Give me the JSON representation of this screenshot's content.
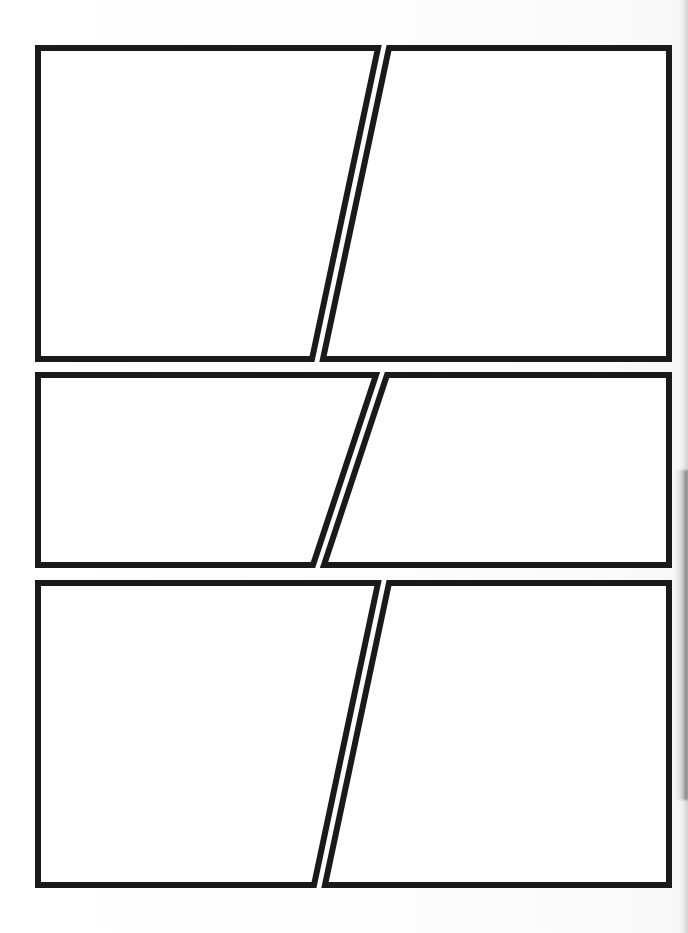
{
  "document": {
    "kind": "comic-page-template",
    "title": "Blank Comic Book Page Template",
    "page_width": 688,
    "page_height": 933,
    "background_color": "#fdfdfd",
    "border_color": "#1a1a1a",
    "panel_fill_color": "#ffffff",
    "border_thickness_px": 6,
    "row_count": 3,
    "panels_per_row": 2,
    "total_panels": 6,
    "text_content": "",
    "notes_visible": ""
  },
  "artifact": {
    "name": "scan-edge-shadow",
    "edge": "right",
    "color": "#4a4a4a"
  },
  "rows": [
    {
      "id": "row-1",
      "label": "Row 1",
      "top": 45,
      "bottom": 362,
      "panels": [
        {
          "id": "panel-1",
          "label": "Panel 1",
          "position": "left",
          "points": "38,48 378,48 312,359 38,359"
        },
        {
          "id": "panel-2",
          "label": "Panel 2",
          "position": "right",
          "points": "389,48 669,48 669,359 323,359"
        }
      ]
    },
    {
      "id": "row-2",
      "label": "Row 2",
      "top": 372,
      "bottom": 568,
      "panels": [
        {
          "id": "panel-3",
          "label": "Panel 3",
          "position": "left",
          "points": "38,375 376,375 313,565 38,565"
        },
        {
          "id": "panel-4",
          "label": "Panel 4",
          "position": "right",
          "points": "387,375 669,375 669,565 324,565"
        }
      ]
    },
    {
      "id": "row-3",
      "label": "Row 3",
      "top": 580,
      "bottom": 888,
      "panels": [
        {
          "id": "panel-5",
          "label": "Panel 5",
          "position": "left",
          "points": "38,583 378,583 314,885 38,885"
        },
        {
          "id": "panel-6",
          "label": "Panel 6",
          "position": "right",
          "points": "389,583 669,583 669,885 325,885"
        }
      ]
    }
  ]
}
